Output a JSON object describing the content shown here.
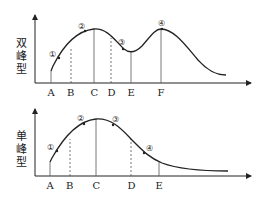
{
  "diagrams": [
    {
      "id": "double-peak",
      "ylabel_chars": [
        "双",
        "峰",
        "型"
      ],
      "x_ticks": [
        "A",
        "B",
        "C",
        "D",
        "E",
        "F"
      ],
      "markers": [
        "①",
        "②",
        "③",
        "④"
      ],
      "solid_lines": [
        "A",
        "C",
        "E",
        "F"
      ],
      "dashed_lines": [
        "B",
        "D"
      ]
    },
    {
      "id": "single-peak",
      "ylabel_chars": [
        "单",
        "峰",
        "型"
      ],
      "x_ticks": [
        "A",
        "B",
        "C",
        "D",
        "E"
      ],
      "markers": [
        "①",
        "②",
        "③",
        "④"
      ],
      "solid_lines": [
        "A",
        "C",
        "E"
      ],
      "dashed_lines": [
        "B",
        "D"
      ]
    }
  ],
  "colors": {
    "line": "#222222",
    "guide": "#555555"
  }
}
